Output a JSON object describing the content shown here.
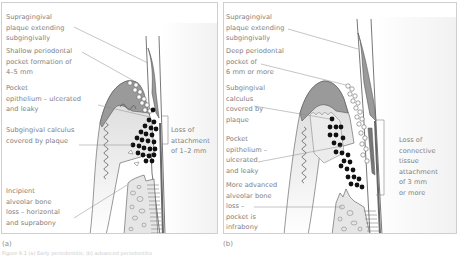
{
  "figure": {
    "panels": [
      {
        "id": "a",
        "letter": "(a)",
        "labels": {
          "supragingival": "Supragingival\nplaque extending\nsubgingivally",
          "pocket": "Shallow periodontal\npocket formation of\n4–5 mm",
          "epithelium": "Pocket\nepithelium – ulcerated\nand leaky",
          "calculus": "Subgingival calculus\ncovered by plaque",
          "bone": "Incipient\nalveolar bone\nloss – horizontal\nand suprabony",
          "attachment": "Loss of\nattachment\nof 1–2 mm"
        }
      },
      {
        "id": "b",
        "letter": "(b)",
        "labels": {
          "supragingival": "Supragingival\nplaque extending\nsubgingivally",
          "pocket": "Deep periodontal\npocket of\n6 mm or more",
          "calculus": "Subgingival\ncalculus\ncovered by\nplaque",
          "epithelium": "Pocket\nepithelium –\nulcerated\nand leaky",
          "bone": "More advanced\nalveolar bone\nloss –\npocket is\ninfrabony",
          "attachment": "Loss of\nconnective\ntissue\nattachment\nof 3 mm\nor more"
        }
      }
    ],
    "caption": "Figure 9.1 (a) Early periodontitis; (b) advanced periodontitis",
    "colors": {
      "gingiva": "#9a9a9a",
      "gingiva_light": "#e2e2e2",
      "calculus": "#111111",
      "leader_line": "#8a8a8a",
      "border": "#cfcfcf",
      "text": "#7e7e7e"
    }
  }
}
